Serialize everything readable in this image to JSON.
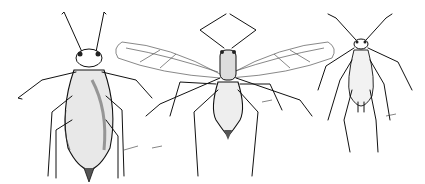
{
  "figure": {
    "description": "Line illustrations of three aphids",
    "specimens": [
      {
        "id": "left",
        "label": "wingless adult aphid"
      },
      {
        "id": "center",
        "label": "winged adult aphid"
      },
      {
        "id": "right",
        "label": "aphid nymph"
      }
    ],
    "colors": {
      "ink": "#111111",
      "background": "#ffffff"
    }
  }
}
